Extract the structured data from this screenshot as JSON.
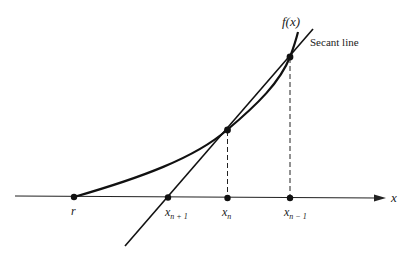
{
  "diagram": {
    "function_label": "f(x)",
    "secant_label": "Secant line",
    "axis_label": "x",
    "points": {
      "root": "r",
      "x_next": {
        "base": "x",
        "sub": "n + 1"
      },
      "x_curr": {
        "base": "x",
        "sub": "n"
      },
      "x_prev": {
        "base": "x",
        "sub": "n − 1"
      }
    }
  }
}
